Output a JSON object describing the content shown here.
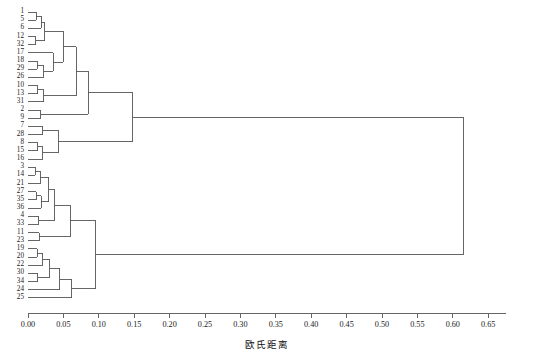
{
  "chart_data": {
    "type": "dendrogram",
    "title": "",
    "xlabel": "欧氏距离",
    "ylabel": "",
    "xlim": [
      0.0,
      0.675
    ],
    "xticks": [
      "0.00",
      "0.05",
      "0.10",
      "0.15",
      "0.20",
      "0.25",
      "0.30",
      "0.35",
      "0.40",
      "0.45",
      "0.50",
      "0.55",
      "0.60",
      "0.65"
    ],
    "xtick_values": [
      0.0,
      0.05,
      0.1,
      0.15,
      0.2,
      0.25,
      0.3,
      0.35,
      0.4,
      0.45,
      0.5,
      0.55,
      0.6,
      0.65
    ],
    "grid": false,
    "legend": "none",
    "orientation": "horizontal-left-to-right",
    "line_color": "#555555",
    "leaf_order": [
      "1",
      "5",
      "6",
      "12",
      "32",
      "17",
      "18",
      "29",
      "26",
      "10",
      "13",
      "31",
      "2",
      "9",
      "7",
      "28",
      "8",
      "15",
      "16",
      "3",
      "14",
      "21",
      "27",
      "35",
      "36",
      "4",
      "33",
      "11",
      "23",
      "19",
      "20",
      "22",
      "30",
      "34",
      "24",
      "25"
    ],
    "n_leaves": 36,
    "root_distance": 0.615,
    "merges": [
      {
        "id": "m1",
        "left": "leaf:1",
        "right": "leaf:5",
        "distance": 0.012
      },
      {
        "id": "m2",
        "left": "m1",
        "right": "leaf:6",
        "distance": 0.019
      },
      {
        "id": "m3",
        "left": "leaf:12",
        "right": "leaf:32",
        "distance": 0.011
      },
      {
        "id": "m4",
        "left": "m3",
        "right": "m2",
        "distance": 0.024
      },
      {
        "id": "m5",
        "left": "leaf:18",
        "right": "leaf:29",
        "distance": 0.013
      },
      {
        "id": "m6",
        "left": "m5",
        "right": "leaf:26",
        "distance": 0.022
      },
      {
        "id": "m7",
        "left": "leaf:17",
        "right": "m6",
        "distance": 0.036
      },
      {
        "id": "m8",
        "left": "m4",
        "right": "m7",
        "distance": 0.05
      },
      {
        "id": "m9",
        "left": "leaf:10",
        "right": "leaf:13",
        "distance": 0.014
      },
      {
        "id": "m10",
        "left": "m9",
        "right": "leaf:31",
        "distance": 0.022
      },
      {
        "id": "m11",
        "left": "m8",
        "right": "m10",
        "distance": 0.068
      },
      {
        "id": "m12",
        "left": "leaf:2",
        "right": "leaf:9",
        "distance": 0.018
      },
      {
        "id": "m13",
        "left": "m11",
        "right": "m12",
        "distance": 0.085
      },
      {
        "id": "m14",
        "left": "leaf:7",
        "right": "leaf:28",
        "distance": 0.021
      },
      {
        "id": "m15",
        "left": "leaf:8",
        "right": "leaf:15",
        "distance": 0.014
      },
      {
        "id": "m16",
        "left": "m15",
        "right": "leaf:16",
        "distance": 0.021
      },
      {
        "id": "m17",
        "left": "m14",
        "right": "m16",
        "distance": 0.043
      },
      {
        "id": "m18",
        "left": "m13",
        "right": "m17",
        "distance": 0.148
      },
      {
        "id": "m19",
        "left": "leaf:3",
        "right": "leaf:14",
        "distance": 0.01
      },
      {
        "id": "m20",
        "left": "m19",
        "right": "leaf:21",
        "distance": 0.017
      },
      {
        "id": "m21",
        "left": "leaf:27",
        "right": "leaf:35",
        "distance": 0.012
      },
      {
        "id": "m22",
        "left": "m21",
        "right": "leaf:36",
        "distance": 0.019
      },
      {
        "id": "m23",
        "left": "m20",
        "right": "m22",
        "distance": 0.029
      },
      {
        "id": "m24",
        "left": "leaf:4",
        "right": "leaf:33",
        "distance": 0.015
      },
      {
        "id": "m25",
        "left": "m23",
        "right": "m24",
        "distance": 0.038
      },
      {
        "id": "m26",
        "left": "leaf:11",
        "right": "leaf:23",
        "distance": 0.016
      },
      {
        "id": "m27",
        "left": "m25",
        "right": "m26",
        "distance": 0.06
      },
      {
        "id": "m28",
        "left": "leaf:19",
        "right": "leaf:20",
        "distance": 0.013
      },
      {
        "id": "m29",
        "left": "m28",
        "right": "leaf:22",
        "distance": 0.021
      },
      {
        "id": "m30",
        "left": "leaf:30",
        "right": "leaf:34",
        "distance": 0.014
      },
      {
        "id": "m31",
        "left": "m29",
        "right": "m30",
        "distance": 0.031
      },
      {
        "id": "m32",
        "left": "m31",
        "right": "leaf:24",
        "distance": 0.045
      },
      {
        "id": "m33",
        "left": "m32",
        "right": "leaf:25",
        "distance": 0.062
      },
      {
        "id": "m34",
        "left": "m27",
        "right": "m33",
        "distance": 0.096
      },
      {
        "id": "m35",
        "left": "m18",
        "right": "m34",
        "distance": 0.615
      }
    ]
  }
}
